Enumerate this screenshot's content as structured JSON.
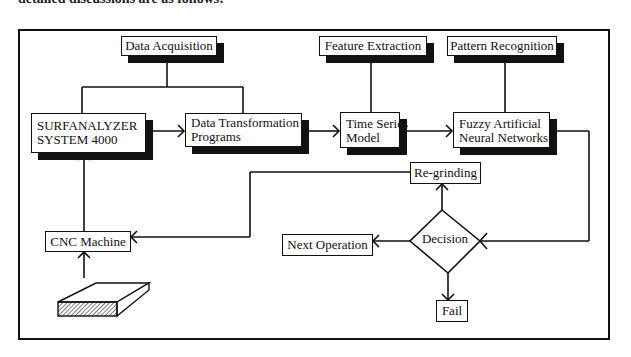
{
  "caption_top": "detailed discussions are as follows:",
  "nodes": {
    "data_acquisition": "Data Acquisition",
    "feature_extraction": "Feature Extraction",
    "pattern_recognition": "Pattern Recognition",
    "surfanalyzer_line1": "SURFANALYZER",
    "surfanalyzer_line2": "SYSTEM 4000",
    "data_transformation_line1": "Data Transformation",
    "data_transformation_line2": "Programs",
    "time_series_line1": "Time Series",
    "time_series_line2": "Model",
    "fuzzy_line1": "Fuzzy Artificial",
    "fuzzy_line2": "Neural Networks",
    "re_grinding": "Re-grinding",
    "decision": "Decision",
    "next_operation": "Next Operation",
    "fail": "Fail",
    "cnc_machine": "CNC Machine"
  },
  "icons": {
    "workpiece": "workpiece-block-icon"
  },
  "colors": {
    "line": "#111111",
    "background": "#ffffff"
  }
}
